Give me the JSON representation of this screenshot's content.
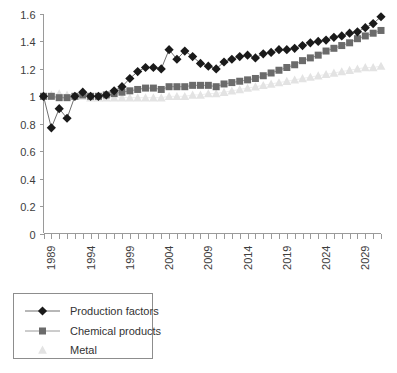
{
  "chart_data": {
    "type": "line",
    "title": "",
    "subtitle": "",
    "xlabel": "",
    "ylabel": "",
    "xlim": [
      1988,
      2031
    ],
    "ylim": [
      0,
      1.6
    ],
    "ytick_labels": [
      "0",
      "0.2",
      "0.4",
      "0.6",
      "0.8",
      "1",
      "1.2",
      "1.4",
      "1.6"
    ],
    "ytick_values": [
      0,
      0.2,
      0.4,
      0.6,
      0.8,
      1.0,
      1.2,
      1.4,
      1.6
    ],
    "xtick_labels": [
      "1989",
      "1994",
      "1999",
      "2004",
      "2009",
      "2014",
      "2019",
      "2024",
      "2029"
    ],
    "xtick_values": [
      1989,
      1994,
      1999,
      2004,
      2009,
      2014,
      2019,
      2024,
      2029
    ],
    "grid": false,
    "legend_position": "below-left",
    "x": [
      1988,
      1989,
      1990,
      1991,
      1992,
      1993,
      1994,
      1995,
      1996,
      1997,
      1998,
      1999,
      2000,
      2001,
      2002,
      2003,
      2004,
      2005,
      2006,
      2007,
      2008,
      2009,
      2010,
      2011,
      2012,
      2013,
      2014,
      2015,
      2016,
      2017,
      2018,
      2019,
      2020,
      2021,
      2022,
      2023,
      2024,
      2025,
      2026,
      2027,
      2028,
      2029,
      2030,
      2031
    ],
    "series": [
      {
        "name": "Production factors",
        "marker": "diamond",
        "color": "#1a1a1a",
        "line_color": "#707070",
        "values": [
          1.0,
          0.77,
          0.91,
          0.84,
          1.0,
          1.03,
          1.0,
          1.0,
          1.01,
          1.04,
          1.07,
          1.13,
          1.18,
          1.21,
          1.21,
          1.2,
          1.34,
          1.27,
          1.33,
          1.29,
          1.24,
          1.22,
          1.2,
          1.25,
          1.27,
          1.29,
          1.3,
          1.28,
          1.31,
          1.32,
          1.34,
          1.34,
          1.35,
          1.37,
          1.39,
          1.4,
          1.41,
          1.43,
          1.44,
          1.46,
          1.47,
          1.5,
          1.53,
          1.58
        ]
      },
      {
        "name": "Chemical products",
        "marker": "square",
        "color": "#6b6b6b",
        "line_color": "#9a9a9a",
        "values": [
          1.0,
          1.0,
          0.99,
          0.99,
          1.0,
          1.01,
          1.0,
          1.0,
          1.01,
          1.02,
          1.03,
          1.04,
          1.05,
          1.06,
          1.06,
          1.05,
          1.07,
          1.07,
          1.07,
          1.08,
          1.08,
          1.08,
          1.07,
          1.09,
          1.1,
          1.11,
          1.12,
          1.13,
          1.15,
          1.17,
          1.19,
          1.21,
          1.23,
          1.26,
          1.28,
          1.3,
          1.33,
          1.35,
          1.37,
          1.39,
          1.42,
          1.44,
          1.46,
          1.48
        ]
      },
      {
        "name": "Metal",
        "marker": "triangle",
        "color": "#e3e3e3",
        "line_color": "#eeeeee",
        "values": [
          1.0,
          1.01,
          1.02,
          1.01,
          1.0,
          1.0,
          0.99,
          0.99,
          0.99,
          0.99,
          0.99,
          0.99,
          0.99,
          0.99,
          0.99,
          0.99,
          1.0,
          1.0,
          1.0,
          1.01,
          1.01,
          1.02,
          1.02,
          1.03,
          1.04,
          1.05,
          1.06,
          1.07,
          1.08,
          1.09,
          1.1,
          1.11,
          1.12,
          1.13,
          1.14,
          1.15,
          1.16,
          1.17,
          1.18,
          1.19,
          1.2,
          1.21,
          1.21,
          1.22
        ]
      }
    ]
  },
  "legend": {
    "items": [
      {
        "label": "Production factors"
      },
      {
        "label": "Chemical products"
      },
      {
        "label": "Metal"
      }
    ]
  }
}
